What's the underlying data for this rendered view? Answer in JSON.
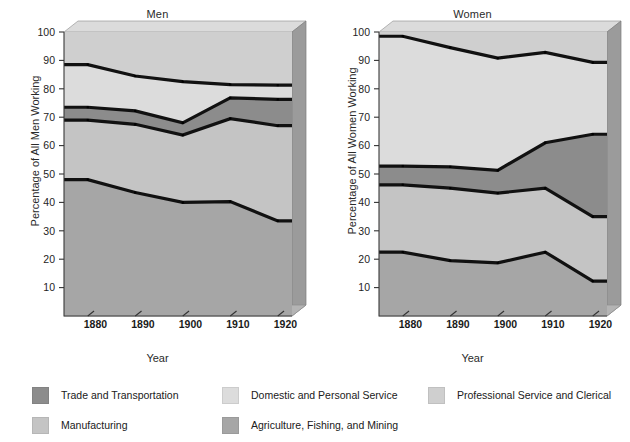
{
  "figure": {
    "xlabel": "Year",
    "panels": [
      {
        "key": "men",
        "title": "Men",
        "ylabel": "Percentage of All Men Working"
      },
      {
        "key": "women",
        "title": "Women",
        "ylabel": "Percentage of All Women Working"
      }
    ]
  },
  "legend": {
    "items": [
      {
        "label": "Trade and Transportation",
        "color": "#8c8c8c",
        "row": 1,
        "col": 1
      },
      {
        "label": "Domestic and Personal Service",
        "color": "#dcdcdc",
        "row": 1,
        "col": 2
      },
      {
        "label": "Professional Service and Clerical",
        "color": "#cfcfcf",
        "row": 1,
        "col": 3
      },
      {
        "label": "Manufacturing",
        "color": "#c4c4c4",
        "row": 2,
        "col": 1
      },
      {
        "label": "Agriculture, Fishing, and Mining",
        "color": "#a6a6a6",
        "row": 2,
        "col": 2
      }
    ]
  },
  "chart_data": {
    "type": "area",
    "title": "",
    "xlabel": "Year",
    "x": [
      1880,
      1890,
      1900,
      1910,
      1920
    ],
    "xlim": [
      1875,
      1923
    ],
    "ylim": [
      0,
      100
    ],
    "yticks": [
      10,
      20,
      30,
      40,
      50,
      60,
      70,
      80,
      90,
      100
    ],
    "xticks": [
      1880,
      1890,
      1900,
      1910,
      1920
    ],
    "grid": false,
    "legend_position": "below",
    "panels": [
      {
        "name": "Men",
        "ylabel": "Percentage of All Men Working",
        "series": [
          {
            "name": "Agriculture, Fishing, and Mining (cumulative upper)",
            "values": [
              48.0,
              43.5,
              40.0,
              40.3,
              33.5
            ]
          },
          {
            "name": "Manufacturing (cumulative upper)",
            "values": [
              69.0,
              67.5,
              63.7,
              69.5,
              67.0
            ]
          },
          {
            "name": "Trade and Transportation (cumulative upper)",
            "values": [
              73.5,
              72.2,
              68.0,
              76.8,
              76.3
            ]
          },
          {
            "name": "Domestic and Personal Service (cumulative upper)",
            "values": [
              88.5,
              84.5,
              82.5,
              81.5,
              81.3
            ]
          }
        ]
      },
      {
        "name": "Women",
        "ylabel": "Percentage of All Women Working",
        "series": [
          {
            "name": "Agriculture, Fishing, and Mining (cumulative upper)",
            "values": [
              22.5,
              19.5,
              18.7,
              22.5,
              12.3
            ]
          },
          {
            "name": "Manufacturing (cumulative upper)",
            "values": [
              46.2,
              45.0,
              43.3,
              45.0,
              35.0
            ]
          },
          {
            "name": "Trade and Transportation (cumulative upper)",
            "values": [
              52.8,
              52.5,
              51.3,
              61.0,
              64.0
            ]
          },
          {
            "name": "Domestic and Personal Service (cumulative upper)",
            "values": [
              98.5,
              94.5,
              90.8,
              92.8,
              89.3
            ]
          }
        ]
      }
    ],
    "band_colors": {
      "agriculture": "#a6a6a6",
      "manufacturing": "#c4c4c4",
      "trade": "#8c8c8c",
      "domestic": "#dcdcdc",
      "professional": "#cfcfcf"
    }
  }
}
